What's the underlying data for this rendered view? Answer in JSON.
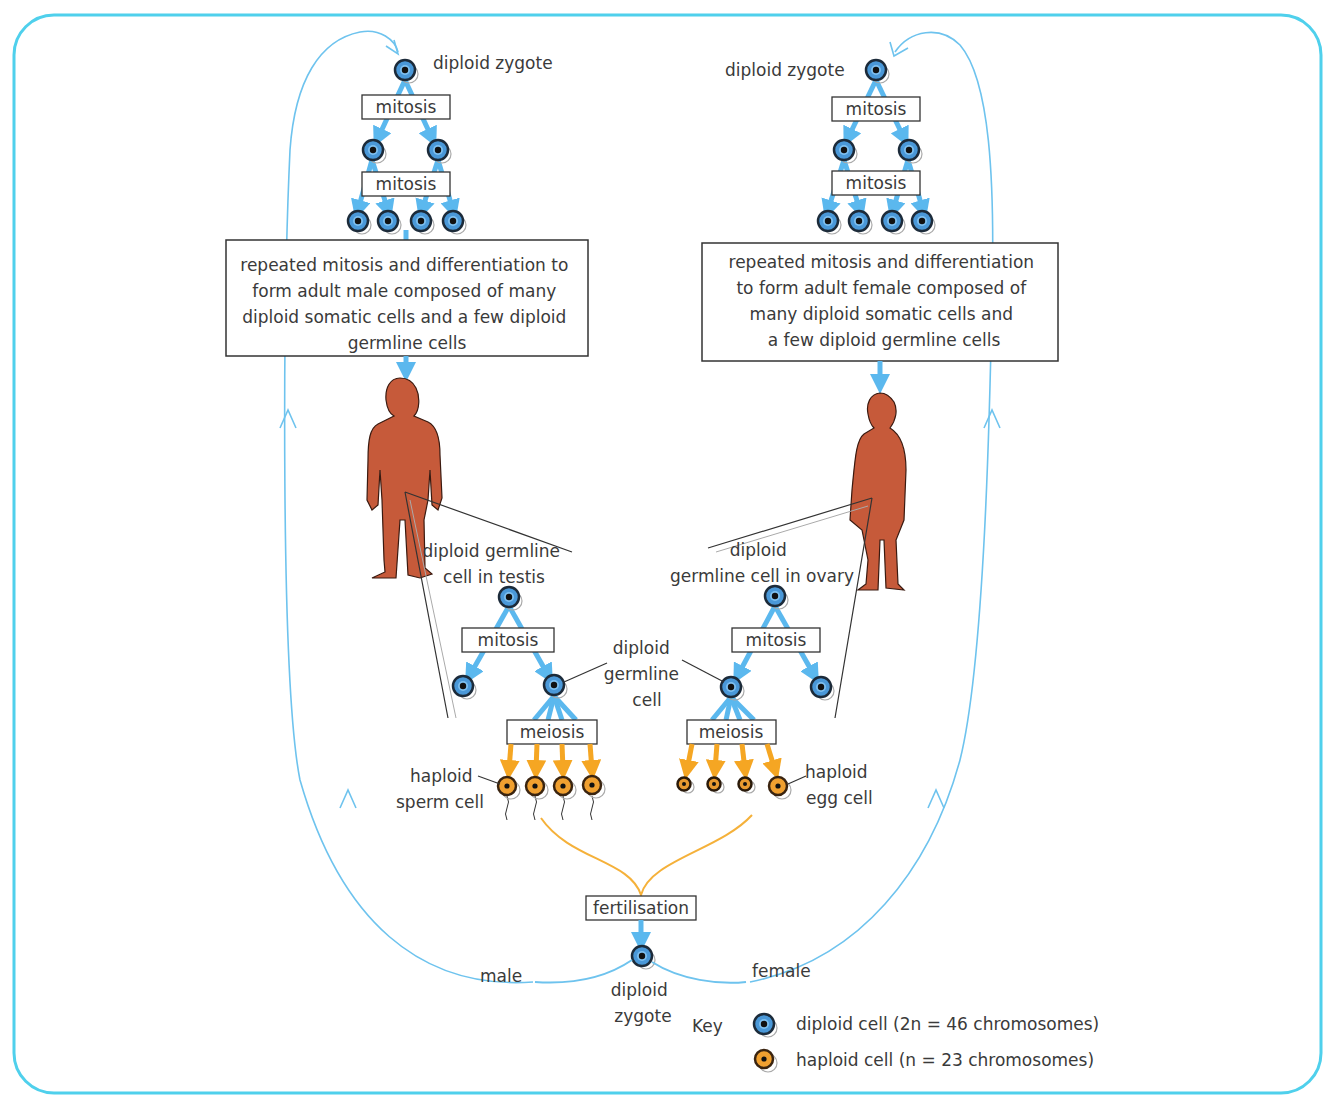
{
  "colors": {
    "frame": "#4fd0ec",
    "cycle_arrow": "#6ec3ee",
    "diploid_arrow": "#5bb8ee",
    "haploid_arrow": "#f5a623",
    "fertilisation_line": "#f5b13a",
    "diploid_cell_fill": "#4a98d8",
    "haploid_cell_fill": "#f0a030",
    "human_fill": "#c65a3a",
    "text": "#3a3a3a"
  },
  "male": {
    "zygote_label": "diploid zygote",
    "mitosis_1": "mitosis",
    "mitosis_2": "mitosis",
    "development_text": [
      "repeated mitosis and differentiation to",
      "form adult male composed of many",
      "diploid somatic cells and a few diploid",
      "germline cells"
    ],
    "germline_label": [
      "diploid germline",
      "cell in testis"
    ],
    "germline_mitosis": "mitosis",
    "meiosis": "meiosis",
    "haploid_label": [
      "haploid",
      "sperm cell"
    ],
    "side_label": "male"
  },
  "female": {
    "zygote_label": "diploid zygote",
    "mitosis_1": "mitosis",
    "mitosis_2": "mitosis",
    "development_text": [
      "repeated mitosis and differentiation",
      "to form adult female composed of",
      "many diploid somatic cells and",
      "a few diploid germline cells"
    ],
    "germline_label": [
      "diploid",
      "germline cell in ovary"
    ],
    "germline_mitosis": "mitosis",
    "meiosis": "meiosis",
    "haploid_label": [
      "haploid",
      "egg cell"
    ],
    "side_label": "female"
  },
  "center": {
    "germline_cell_label": [
      "diploid",
      "germline",
      "cell"
    ],
    "fertilisation": "fertilisation",
    "zygote_label": [
      "diploid",
      "zygote"
    ]
  },
  "key": {
    "title": "Key",
    "items": [
      {
        "icon": "diploid-cell-icon",
        "label": "diploid cell (2n = 46 chromosomes)"
      },
      {
        "icon": "haploid-cell-icon",
        "label": "haploid cell (n = 23 chromosomes)"
      }
    ]
  }
}
